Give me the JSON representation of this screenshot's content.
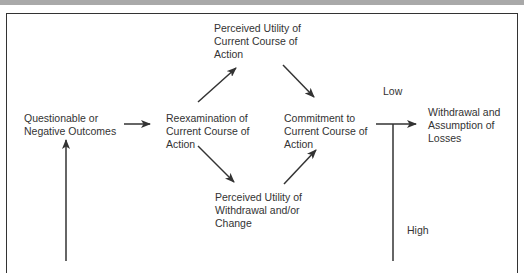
{
  "header": {
    "strip_color": "#a9a9a9"
  },
  "diagram": {
    "nodes": {
      "questionable": {
        "line1": "Questionable or",
        "line2": "Negative Outcomes"
      },
      "reexamination": {
        "line1": "Reexamination of",
        "line2": "Current Course of",
        "line3": "Action"
      },
      "utility_current": {
        "line1": "Perceived Utility of",
        "line2": "Current Course of",
        "line3": "Action"
      },
      "utility_withdrawal": {
        "line1": "Perceived Utility of",
        "line2": "Withdrawal and/or",
        "line3": "Change"
      },
      "commitment": {
        "line1": "Commitment to",
        "line2": "Current Course of",
        "line3": "Action"
      },
      "withdrawal": {
        "line1": "Withdrawal and",
        "line2": "Assumption of",
        "line3": "Losses"
      }
    },
    "labels": {
      "low": "Low",
      "high": "High"
    },
    "edges": [
      {
        "from": "questionable",
        "to": "reexamination"
      },
      {
        "from": "reexamination",
        "to": "utility_current"
      },
      {
        "from": "reexamination",
        "to": "utility_withdrawal"
      },
      {
        "from": "utility_current",
        "to": "commitment"
      },
      {
        "from": "utility_withdrawal",
        "to": "commitment"
      },
      {
        "from": "commitment",
        "to": "withdrawal",
        "label": "Low"
      },
      {
        "from": "commitment",
        "to": "questionable",
        "label": "High",
        "note": "feedback loop continues below visible area"
      }
    ],
    "line_color": "#333333"
  }
}
